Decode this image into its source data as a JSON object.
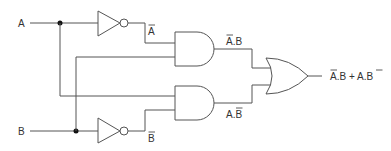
{
  "diagram": {
    "type": "logic-circuit",
    "function": "XOR",
    "inputs": [
      {
        "id": "A",
        "label": "A"
      },
      {
        "id": "B",
        "label": "B"
      }
    ],
    "gates": [
      {
        "id": "not_a",
        "type": "NOT",
        "input": "A",
        "output_label": "A",
        "output_overline": true
      },
      {
        "id": "not_b",
        "type": "NOT",
        "input": "B",
        "output_label": "B",
        "output_overline": true
      },
      {
        "id": "and_1",
        "type": "AND",
        "inputs": [
          "not A",
          "B"
        ],
        "output_label": "A.B",
        "overlined_term": "A"
      },
      {
        "id": "and_2",
        "type": "AND",
        "inputs": [
          "A",
          "not B"
        ],
        "output_label": "A.B",
        "overlined_term": "B"
      },
      {
        "id": "or_1",
        "type": "OR",
        "inputs": [
          "and_1",
          "and_2"
        ],
        "output_label": "A.B + A.B"
      }
    ],
    "labels": {
      "input_a": "A",
      "input_b": "B",
      "not_a_out": "A",
      "not_b_out": "B",
      "and1_out": "A.B",
      "and2_out": "A.B",
      "or_out": "A.B + A.B"
    },
    "output_expression": "A̅.B + A.B̅"
  }
}
